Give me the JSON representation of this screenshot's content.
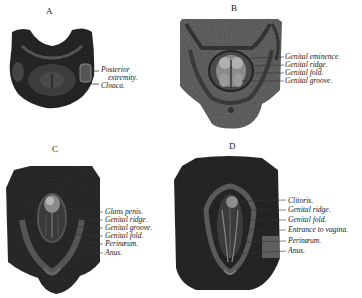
{
  "figure": {
    "panels": [
      {
        "letter": "A",
        "labels": [
          "Posterior",
          "extremity.",
          "Cloaca."
        ]
      },
      {
        "letter": "B",
        "labels": [
          "Genital eminence.",
          "Genital ridge.",
          "Genital fold.",
          "Genital groove."
        ]
      },
      {
        "letter": "C",
        "labels": [
          "Glans penis.",
          "Genital ridge.",
          "Genital groove.",
          "Genital fold.",
          "Perinæum.",
          "Anus."
        ]
      },
      {
        "letter": "D",
        "labels": [
          "Clitoris.",
          "Genital ridge.",
          "Genital fold.",
          "Entrance to vagina.",
          "Perinæum.",
          "Anus."
        ]
      }
    ]
  }
}
